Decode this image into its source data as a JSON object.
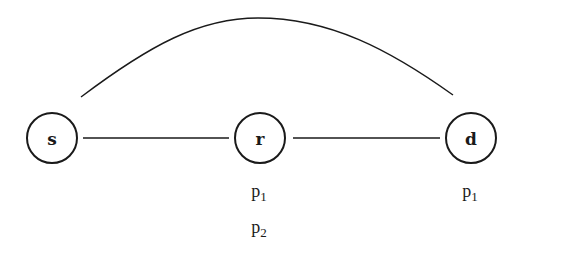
{
  "diagram": {
    "type": "network-graph",
    "nodes": [
      {
        "id": "s",
        "label": "s",
        "cx": 52,
        "cy": 138,
        "r": 25
      },
      {
        "id": "r",
        "label": "r",
        "cx": 260,
        "cy": 138,
        "r": 25
      },
      {
        "id": "d",
        "label": "d",
        "cx": 471,
        "cy": 138,
        "r": 25
      }
    ],
    "edges": [
      {
        "from": "s",
        "to": "r",
        "shape": "straight"
      },
      {
        "from": "r",
        "to": "d",
        "shape": "straight"
      },
      {
        "from": "s",
        "to": "d",
        "shape": "arc"
      }
    ],
    "annotations": {
      "r": [
        {
          "base": "p",
          "sub": "1"
        },
        {
          "base": "p",
          "sub": "2"
        }
      ],
      "d": [
        {
          "base": "p",
          "sub": "1"
        }
      ]
    },
    "colors": {
      "stroke": "#1a1a1a",
      "background": "#ffffff"
    }
  }
}
